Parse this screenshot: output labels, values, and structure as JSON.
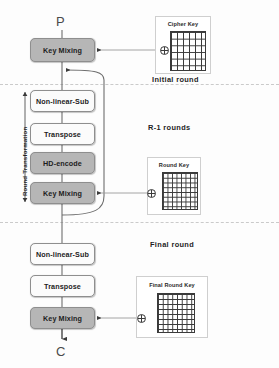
{
  "diagram": {
    "input_label": "P",
    "output_label": "C",
    "vertical_label": "Round  Transformation",
    "sections": [
      {
        "id": "initial",
        "label": "Initial round"
      },
      {
        "id": "middle",
        "label": "R-1  rounds"
      },
      {
        "id": "final",
        "label": "Final round"
      }
    ],
    "blocks": [
      {
        "id": "initial-key-mixing",
        "label": "Key Mixing",
        "fill": "grey",
        "section": "initial"
      },
      {
        "id": "round-non-linear-sub",
        "label": "Non-linear-Sub",
        "fill": "white",
        "section": "middle"
      },
      {
        "id": "round-transpose",
        "label": "Transpose",
        "fill": "white",
        "section": "middle"
      },
      {
        "id": "round-hd-encode",
        "label": "HD-encode",
        "fill": "grey",
        "section": "middle"
      },
      {
        "id": "round-key-mixing",
        "label": "Key Mixing",
        "fill": "grey",
        "section": "middle"
      },
      {
        "id": "final-non-linear-sub",
        "label": "Non-linear-Sub",
        "fill": "white",
        "section": "final"
      },
      {
        "id": "final-transpose",
        "label": "Transpose",
        "fill": "white",
        "section": "final"
      },
      {
        "id": "final-key-mixing",
        "label": "Key Mixing",
        "fill": "grey",
        "section": "final"
      }
    ],
    "keys": [
      {
        "id": "cipher-key",
        "label": "Cipher Key",
        "cells": 6,
        "operator": "xor"
      },
      {
        "id": "round-key",
        "label": "Round Key",
        "cells": 8,
        "operator": "xor"
      },
      {
        "id": "final-round-key",
        "label": "Final Round Key",
        "cells": 8,
        "operator": "xor"
      }
    ],
    "colors": {
      "grey_fill": "#b6b6b6",
      "white_fill": "#fbfbfb",
      "stroke": "#6e6e6e",
      "divider": "#cacaca"
    }
  }
}
